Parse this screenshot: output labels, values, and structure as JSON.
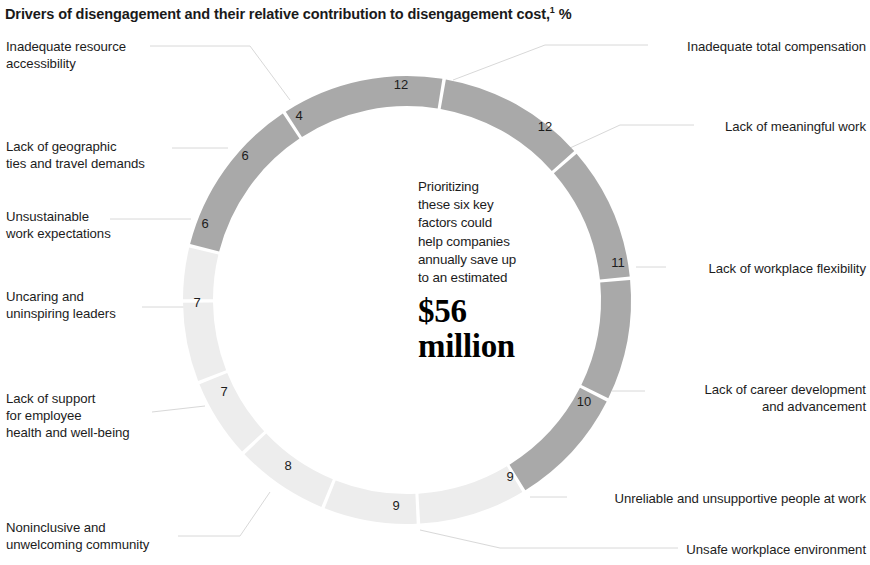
{
  "title": {
    "text": "Drivers of disengagement and their relative contribution to disengagement cost,",
    "footnote_marker": "1",
    "unit": " %"
  },
  "center": {
    "paragraph": "Prioritizing\nthese six key\nfactors could\nhelp companies\nannually save up\nto an estimated",
    "amount": "$56\nmillion"
  },
  "colors": {
    "dark_segment": "#a9a9a9",
    "light_segment": "#ededed",
    "leader_line": "#d8d8d8",
    "text": "#1c1c1c",
    "background": "#ffffff"
  },
  "chart_data": {
    "type": "pie",
    "title": "Drivers of disengagement and their relative contribution to disengagement cost,1 %",
    "xlabel": "",
    "ylabel": "",
    "unit": "%",
    "donut": true,
    "legend": "callout labels around ring",
    "center_annotation": "Prioritizing these six key factors could help companies annually save up to an estimated $56 million",
    "categories": [
      "Inadequate total compensation",
      "Lack of meaningful work",
      "Lack of workplace flexibility",
      "Lack of career development and advancement",
      "Unreliable and unsupportive people at work",
      "Unsafe workplace environment",
      "Noninclusive and unwelcoming community",
      "Lack of support for employee health and well-being",
      "Uncaring and uninspiring leaders",
      "Unsustainable work expectations",
      "Lack of geographic ties and travel demands",
      "Inadequate resource accessibility"
    ],
    "values": [
      12,
      12,
      11,
      10,
      9,
      9,
      8,
      7,
      7,
      6,
      6,
      4
    ],
    "segments": [
      {
        "id": "inadequate-total-compensation",
        "label": "Inadequate total compensation",
        "value": 12,
        "group": "dark",
        "side": "right",
        "label_x": 654,
        "label_y": 38,
        "value_x": 401,
        "value_y": 86,
        "leader": "M 453 80 L 545 45 L 648 45"
      },
      {
        "id": "lack-of-meaningful-work",
        "label": "Lack of meaningful work",
        "value": 12,
        "group": "dark",
        "side": "right",
        "label_x": 700,
        "label_y": 118,
        "value_x": 545,
        "value_y": 128,
        "leader": "M 570 148 L 620 125 L 694 125"
      },
      {
        "id": "lack-of-workplace-flexibility",
        "label": "Lack of workplace flexibility",
        "value": 11,
        "group": "dark",
        "side": "right",
        "label_x": 672,
        "label_y": 260,
        "value_x": 618,
        "value_y": 264,
        "leader": "M 636 267 L 666 267"
      },
      {
        "id": "lack-of-career-development-and-advancement",
        "label": "Lack of career development\nand advancement",
        "value": 10,
        "group": "dark",
        "side": "right",
        "label_x": 651,
        "label_y": 381,
        "value_x": 584,
        "value_y": 403,
        "leader": "M 612 391 L 645 391"
      },
      {
        "id": "unreliable-and-unsupportive-people-at-work",
        "label": "Unreliable and unsupportive people at work",
        "value": 9,
        "group": "dark",
        "side": "right",
        "label_x": 573,
        "label_y": 490,
        "value_x": 510,
        "value_y": 478,
        "leader": "M 530 497 L 567 497"
      },
      {
        "id": "unsafe-workplace-environment",
        "label": "Unsafe workplace environment",
        "value": 9,
        "group": "dark",
        "side": "right",
        "label_x": 684,
        "label_y": 541,
        "value_x": 396,
        "value_y": 507,
        "leader": "M 420 530 L 500 548 L 678 548"
      },
      {
        "id": "noninclusive-and-unwelcoming-community",
        "label": "Noninclusive and\nunwelcoming community",
        "value": 8,
        "group": "light",
        "side": "left",
        "label_x": 6,
        "label_y": 519,
        "value_x": 288,
        "value_y": 467,
        "leader": "M 270 492 L 240 536 L 178 536"
      },
      {
        "id": "lack-of-support-for-employee-health-and-well-being",
        "label": "Lack of support\nfor employee\nhealth and well-being",
        "value": 7,
        "group": "light",
        "side": "left",
        "label_x": 6,
        "label_y": 390,
        "value_x": 224,
        "value_y": 393,
        "leader": "M 205 406 L 152 412"
      },
      {
        "id": "uncaring-and-uninspiring-leaders",
        "label": "Uncaring and\nuninspiring leaders",
        "value": 7,
        "group": "light",
        "side": "left",
        "label_x": 6,
        "label_y": 288,
        "value_x": 197,
        "value_y": 304,
        "leader": "M 184 307 L 142 307"
      },
      {
        "id": "unsustainable-work-expectations",
        "label": "Unsustainable\nwork expectations",
        "value": 6,
        "group": "light",
        "side": "left",
        "label_x": 6,
        "label_y": 208,
        "value_x": 205,
        "value_y": 225,
        "leader": "M 191 219 L 110 219"
      },
      {
        "id": "lack-of-geographic-ties-and-travel-demands",
        "label": "Lack of geographic\nties and travel demands",
        "value": 6,
        "group": "light",
        "side": "left",
        "label_x": 6,
        "label_y": 138,
        "value_x": 245,
        "value_y": 157,
        "leader": "M 228 148 L 172 148"
      },
      {
        "id": "inadequate-resource-accessibility",
        "label": "Inadequate resource\naccessibility",
        "value": 4,
        "group": "light",
        "side": "left",
        "label_x": 6,
        "label_y": 38,
        "value_x": 299,
        "value_y": 117,
        "leader": "M 290 100 L 250 46 L 150 46"
      }
    ]
  }
}
